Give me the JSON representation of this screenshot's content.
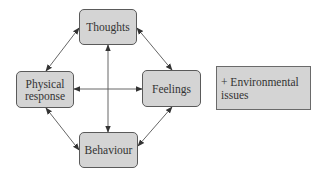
{
  "diagram": {
    "type": "cycle-diagram",
    "colors": {
      "node_fill": "#d4d4d4",
      "node_border": "#5a5a5a",
      "text": "#333333",
      "arrow": "#444444"
    },
    "nodes": {
      "thoughts": {
        "label": "Thoughts"
      },
      "physical": {
        "label_line1": "Physical",
        "label_line2": "response"
      },
      "feelings": {
        "label": "Feelings"
      },
      "behaviour": {
        "label": "Behaviour"
      }
    },
    "side_box": {
      "line1": "+ Environmental",
      "line2": "issues"
    },
    "edges": [
      {
        "from": "Thoughts",
        "to": "Physical response",
        "bidirectional": true
      },
      {
        "from": "Thoughts",
        "to": "Feelings",
        "bidirectional": true
      },
      {
        "from": "Thoughts",
        "to": "Behaviour",
        "bidirectional": true
      },
      {
        "from": "Physical response",
        "to": "Feelings",
        "bidirectional": true
      },
      {
        "from": "Physical response",
        "to": "Behaviour",
        "bidirectional": true
      },
      {
        "from": "Feelings",
        "to": "Behaviour",
        "bidirectional": true
      }
    ]
  }
}
